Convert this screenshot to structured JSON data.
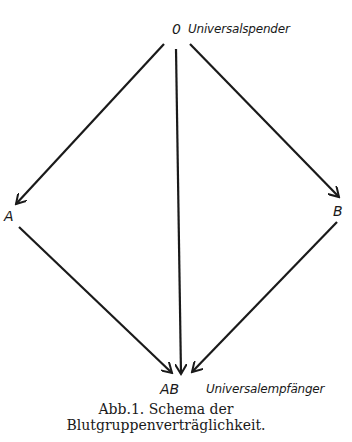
{
  "diagram": {
    "nodes": {
      "o": {
        "label": "0",
        "description": "Universalspender"
      },
      "a": {
        "label": "A"
      },
      "b": {
        "label": "B"
      },
      "ab": {
        "label": "AB",
        "description": "Universalempfänger"
      }
    },
    "edges": [
      {
        "from": "0",
        "to": "A"
      },
      {
        "from": "0",
        "to": "B"
      },
      {
        "from": "0",
        "to": "AB"
      },
      {
        "from": "A",
        "to": "AB"
      },
      {
        "from": "B",
        "to": "AB"
      }
    ],
    "stroke_color": "#1a1a1a"
  },
  "caption": {
    "line1": "Abb.1.  Schema der",
    "line2": "Blutgruppenverträglichkeit."
  }
}
